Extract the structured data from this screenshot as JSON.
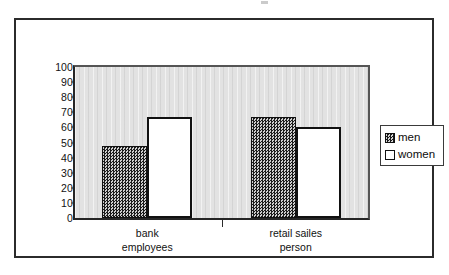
{
  "chart_data": {
    "type": "bar",
    "title": "",
    "subtitle": "",
    "xlabel": "",
    "ylabel": "",
    "categories": [
      "bank employees",
      "retail sailes person"
    ],
    "category_lines": [
      [
        "bank",
        "employees"
      ],
      [
        "retail sailes",
        "person"
      ]
    ],
    "series": [
      {
        "name": "men",
        "values": [
          48,
          67
        ]
      },
      {
        "name": "women",
        "values": [
          67,
          60
        ]
      }
    ],
    "ylim": [
      0,
      100
    ],
    "yticks": [
      0,
      10,
      20,
      30,
      40,
      50,
      60,
      70,
      80,
      90,
      100
    ],
    "ytick_labels": [
      "0",
      "10",
      "20",
      "30",
      "40",
      "50",
      "60",
      "70",
      "80",
      "90",
      "100"
    ],
    "grid": false,
    "legend_position": "right",
    "legend_entries": [
      "men",
      "women"
    ],
    "colors": {
      "men_fill": "#1b1b1b",
      "women_fill": "#ffffff",
      "bar_outline": "#111111",
      "plot_background": "#e2e2e2",
      "frame": "#2b2b2b",
      "axis": "#262626",
      "text": "#111111"
    }
  }
}
